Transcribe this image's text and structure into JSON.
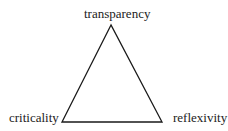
{
  "diagram": {
    "type": "triangle",
    "vertices": {
      "top": {
        "label": "transparency"
      },
      "bottom_left": {
        "label": "criticality"
      },
      "bottom_right": {
        "label": "reflexivity"
      }
    },
    "stroke_color": "#1a1a1a",
    "background": "#ffffff"
  }
}
